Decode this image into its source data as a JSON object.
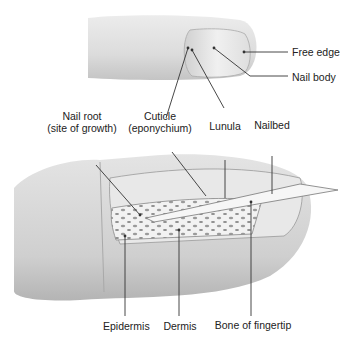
{
  "diagram": {
    "top_view_labels": {
      "free_edge": "Free edge",
      "nail_body": "Nail body"
    },
    "section_labels": {
      "nail_root_line1": "Nail root",
      "nail_root_line2": "(site of growth)",
      "cuticle_line1": "Cuticle",
      "cuticle_line2": "(eponychium)",
      "lunula": "Lunula",
      "nailbed": "Nailbed"
    },
    "bottom_labels": {
      "epidermis": "Epidermis",
      "dermis": "Dermis",
      "bone": "Bone of fingertip"
    },
    "colors": {
      "skin_light": "#e6e6e6",
      "skin_dark": "#bdbdbd",
      "line": "#333333",
      "bone": "#f4f4f4"
    }
  }
}
